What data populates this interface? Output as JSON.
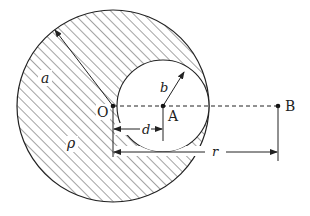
{
  "figure": {
    "labels": {
      "radius_big": "a",
      "radius_small": "b",
      "density": "ρ",
      "center_big": "O",
      "center_small": "A",
      "point_ext": "B",
      "offset": "d",
      "distance": "r"
    },
    "geometry": {
      "big_circle": {
        "cx": 113,
        "cy": 106,
        "r": 96
      },
      "small_circle": {
        "cx": 163,
        "cy": 106,
        "r": 46
      },
      "point_B": {
        "x": 278,
        "y": 106
      }
    },
    "colors": {
      "stroke": "#222222",
      "hatch": "#333333",
      "background": "#ffffff"
    }
  }
}
